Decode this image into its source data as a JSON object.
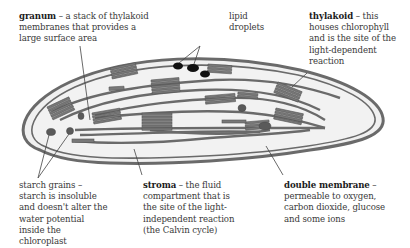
{
  "diagram": {
    "labels": {
      "granum": {
        "term": "granum",
        "description": " – a stack of thylakoid membranes that provides a large surface area"
      },
      "lipid_droplets": {
        "term": "",
        "description": "lipid droplets"
      },
      "thylakoid": {
        "term": "thylakoid",
        "description": " – this houses chlorophyll and is the site of the light-dependent reaction"
      },
      "starch_grains": {
        "term": "",
        "description": "starch grains – starch is insoluble and doesn't alter the water potential inside the chloroplast"
      },
      "stroma": {
        "term": "stroma",
        "description": " – the fluid compartment that is the site of the light-independent reaction (the Calvin cycle)"
      },
      "double_membrane": {
        "term": "double membrane",
        "description": " – permeable to oxygen, carbon dioxide, glucose and some ions"
      }
    },
    "colors": {
      "membrane": "#6e6e6e",
      "stroma_fill": "#efefef",
      "granum_fill": "#777777",
      "lipid": "#111111",
      "starch": "#5a5a5a",
      "leader_line": "#444444"
    }
  }
}
